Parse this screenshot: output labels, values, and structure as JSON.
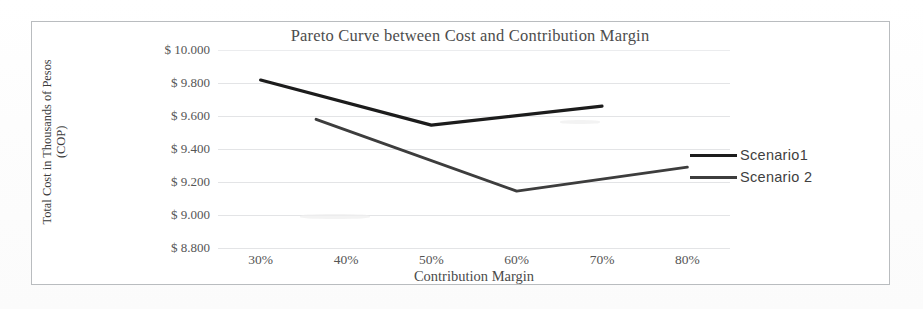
{
  "chart_data": {
    "type": "line",
    "title": "Pareto Curve between Cost and Contribution Margin",
    "xlabel": "Contribution Margin",
    "ylabel": "Total Cost in Thousands of Pesos (COP)",
    "ylabel_line1": "Total Cost in Thousands of Pesos",
    "ylabel_line2": "(COP)",
    "xlim": [
      25,
      85
    ],
    "ylim": [
      8800,
      10000
    ],
    "y_tick_labels": [
      "$ 10.000",
      "$ 9.800",
      "$ 9.600",
      "$ 9.400",
      "$ 9.200",
      "$ 9.000",
      "$ 8.800"
    ],
    "y_tick_values": [
      10000,
      9800,
      9600,
      9400,
      9200,
      9000,
      8800
    ],
    "x_tick_labels": [
      "30%",
      "40%",
      "50%",
      "60%",
      "70%",
      "80%"
    ],
    "x_tick_values": [
      30,
      40,
      50,
      60,
      70,
      80
    ],
    "grid": true,
    "legend_position": "right",
    "series": [
      {
        "name": "Scenario1",
        "color": "#1c1c1c",
        "x": [
          30,
          50,
          70
        ],
        "values": [
          9818,
          9545,
          9660
        ]
      },
      {
        "name": "Scenario 2",
        "color": "#3d3d3d",
        "x": [
          36.5,
          60,
          80
        ],
        "values": [
          9580,
          9145,
          9290
        ]
      }
    ]
  },
  "legend": {
    "items": [
      {
        "label": "Scenario1"
      },
      {
        "label": "Scenario 2"
      }
    ]
  },
  "colors": {
    "scenario1": "#1c1c1c",
    "scenario2": "#3d3d3d",
    "gridline": "#e3e4e6",
    "border": "#b9bcbf"
  }
}
